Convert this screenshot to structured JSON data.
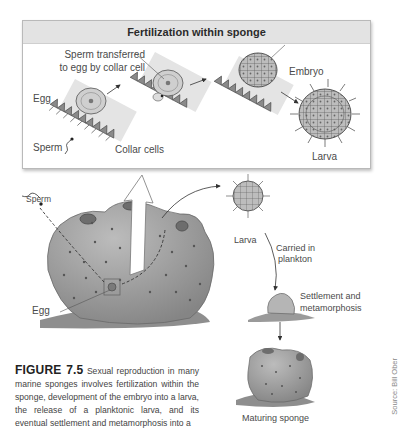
{
  "panel": {
    "title": "Fertilization within sponge",
    "labels": {
      "sperm_transferred_line1": "Sperm transferred",
      "sperm_transferred_line2": "to egg by collar cell",
      "egg": "Egg",
      "sperm": "Sperm",
      "collar_cells": "Collar cells",
      "embryo": "Embryo",
      "larva": "Larva"
    }
  },
  "lifecycle": {
    "labels": {
      "sperm": "Sperm",
      "egg": "Egg",
      "larva": "Larva",
      "carried_line1": "Carried in",
      "carried_line2": "plankton",
      "settlement_line1": "Settlement and",
      "settlement_line2": "metamorphosis",
      "maturing": "Maturing sponge"
    }
  },
  "caption": {
    "figure_number": "FIGURE 7.5",
    "text": "Sexual reproduction in many marine sponges involves fertilization within the sponge, development of the embryo into a larva, the release of a planktonic larva, and its eventual settlement and metamorphosis into a"
  },
  "credit": "Source: Bill Ober",
  "colors": {
    "panel_header": "#e3e3e3",
    "sponge_body": "#9a9a9a",
    "text": "#4a4a4a"
  }
}
